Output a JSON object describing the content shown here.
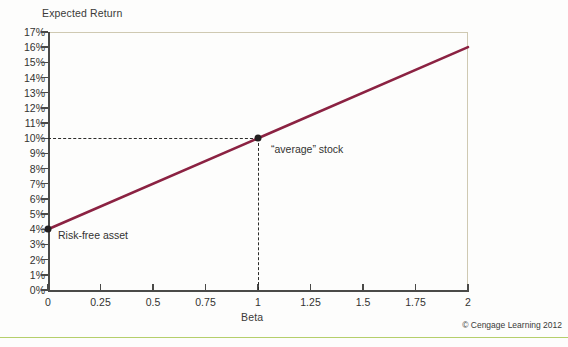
{
  "chart_data": {
    "type": "line",
    "title": "",
    "xlabel": "Beta",
    "ylabel": "Expected Return",
    "xlim": [
      0,
      2
    ],
    "ylim": [
      0,
      17
    ],
    "grid": false,
    "legend": "none",
    "xticks": [
      "0",
      "0.25",
      "0.5",
      "0.75",
      "1",
      "1.25",
      "1.5",
      "1.75",
      "2"
    ],
    "xtick_values": [
      0,
      0.25,
      0.5,
      0.75,
      1,
      1.25,
      1.5,
      1.75,
      2
    ],
    "yticks": [
      "0%",
      "1%",
      "2%",
      "3%",
      "4%",
      "5%",
      "6%",
      "7%",
      "8%",
      "9%",
      "10%",
      "11%",
      "12%",
      "13%",
      "14%",
      "15%",
      "16%",
      "17%"
    ],
    "ytick_values": [
      0,
      1,
      2,
      3,
      4,
      5,
      6,
      7,
      8,
      9,
      10,
      11,
      12,
      13,
      14,
      15,
      16,
      17
    ],
    "series": [
      {
        "name": "Security Market Line",
        "color": "#8b2242",
        "x": [
          0,
          1,
          2
        ],
        "values": [
          4,
          10,
          16
        ]
      }
    ],
    "points": [
      {
        "label": "Risk-free asset",
        "x": 0,
        "y": 4
      },
      {
        "label": "“average” stock",
        "x": 1,
        "y": 10
      }
    ],
    "annotations": [
      {
        "name": "risk-free-asset",
        "text": "Risk-free asset"
      },
      {
        "name": "average-stock",
        "text": "“average” stock"
      }
    ],
    "guides": [
      {
        "type": "horizontal-dashed",
        "y": 10,
        "from_x": 0,
        "to_x": 1
      },
      {
        "type": "vertical-dashed",
        "x": 1,
        "from_y": 0,
        "to_y": 10
      }
    ]
  },
  "axes": {
    "y_title": "Expected Return",
    "x_title": "Beta"
  },
  "footer": {
    "copyright": "© Cengage Learning 2012"
  },
  "colors": {
    "line": "#8b2242",
    "axis": "#4a4a48",
    "plot_border": "#cfc9b2",
    "rule": "#b5cf6b",
    "dash": "#2b2b29",
    "text": "#333331",
    "background": "#fdfdfc"
  }
}
